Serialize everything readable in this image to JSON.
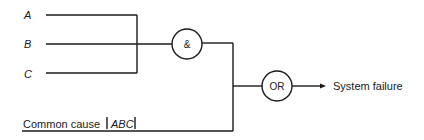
{
  "diagram": {
    "type": "fault-tree",
    "inputs": [
      {
        "id": "A",
        "label": "A"
      },
      {
        "id": "B",
        "label": "B"
      },
      {
        "id": "C",
        "label": "C"
      }
    ],
    "and_gate": {
      "label": "&"
    },
    "or_gate": {
      "label": "OR"
    },
    "output": {
      "label": "System failure"
    },
    "common_cause": {
      "label": "Common cause",
      "group": "ABC"
    }
  }
}
